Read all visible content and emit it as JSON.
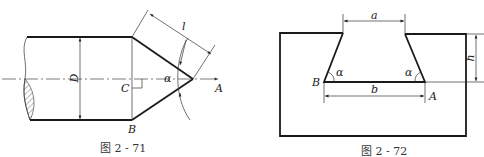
{
  "figures": [
    {
      "caption": "图 2 - 71",
      "labels": {
        "D": "D",
        "l": "l",
        "alpha": "α",
        "C": "C",
        "B": "B",
        "A": "A"
      }
    },
    {
      "caption": "图 2 - 72",
      "labels": {
        "a": "a",
        "b": "b",
        "h": "h",
        "alpha_left": "α",
        "alpha_right": "α",
        "B": "B",
        "A": "A"
      }
    }
  ],
  "colors": {
    "line": "#1a1a1a",
    "background": "#ffffff"
  }
}
